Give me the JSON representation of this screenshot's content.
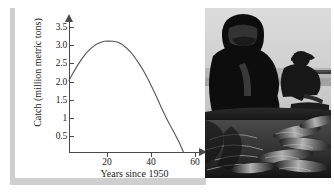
{
  "figure": {
    "caption_alt": "Peruvian anchovy catch curve with photograph of fishermen",
    "photo": {
      "name": "fishermen-photo",
      "description": "Black and white photograph of two fishermen on a boat sorting a large pile of fish",
      "tone": "monochrome"
    }
  },
  "chart_data": {
    "type": "line",
    "title": "",
    "xlabel": "Years since 1950",
    "ylabel": "Catch (million metric tons)",
    "xlim": [
      -2,
      66
    ],
    "ylim": [
      0,
      3.75
    ],
    "xticks": [
      20,
      40,
      60
    ],
    "xticklabels": [
      "20",
      "40",
      "60"
    ],
    "yticks": [
      0.5,
      1,
      1.5,
      2.0,
      2.5,
      3.0,
      3.5
    ],
    "yticklabels": [
      "0.5",
      "1",
      "1.5",
      "2.0",
      "2.5",
      "3.0",
      "3.5"
    ],
    "grid": false,
    "legend": null,
    "series": [
      {
        "name": "Catch",
        "color": "#555555",
        "x": [
          0,
          2,
          4,
          6,
          8,
          10,
          12,
          14,
          16,
          18,
          20,
          22,
          24,
          26,
          28,
          30,
          32,
          34,
          36,
          38,
          40,
          42,
          44,
          46,
          48,
          50,
          52
        ],
        "y": [
          2.0,
          2.23,
          2.44,
          2.62,
          2.78,
          2.9,
          3.0,
          3.06,
          3.1,
          3.11,
          3.1,
          3.08,
          3.02,
          2.92,
          2.8,
          2.64,
          2.46,
          2.26,
          2.03,
          1.78,
          1.52,
          1.24,
          0.98,
          0.74,
          0.52,
          0.28,
          0.0
        ]
      }
    ],
    "annotations": {
      "start_value": 2.0,
      "peak_x": 18,
      "peak_y": 3.1,
      "zero_crossing_x": 52
    }
  }
}
